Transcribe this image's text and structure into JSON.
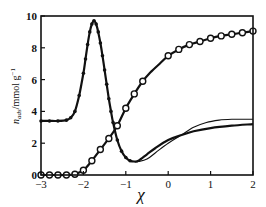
{
  "chart_data": {
    "type": "line",
    "title": "",
    "xlabel": "χ",
    "ylabel": "n_ads /mmol g⁻¹",
    "ylabel_main": "n",
    "ylabel_sub": "ads",
    "ylabel_units": "/mmol g",
    "ylabel_exp": "−1",
    "xlim": [
      -3,
      2
    ],
    "ylim": [
      0,
      10
    ],
    "x_ticks": [
      -3,
      -2,
      -1,
      0,
      1,
      2
    ],
    "x_tick_labels": [
      "−3",
      "−2",
      "−1",
      "0",
      "1",
      "2"
    ],
    "y_ticks": [
      0,
      2,
      4,
      6,
      8,
      10
    ],
    "y_tick_labels": [
      "0",
      "2",
      "4",
      "6",
      "8",
      "10"
    ],
    "grid": false,
    "legend": null,
    "series": [
      {
        "name": "peak-curve-fit",
        "style": "solid-line",
        "markers": "filled-dots",
        "x": [
          -3.0,
          -2.8,
          -2.6,
          -2.4,
          -2.3,
          -2.2,
          -2.1,
          -2.0,
          -1.95,
          -1.9,
          -1.85,
          -1.8,
          -1.75,
          -1.7,
          -1.65,
          -1.6,
          -1.55,
          -1.5,
          -1.45,
          -1.4,
          -1.35,
          -1.3,
          -1.2,
          -1.1,
          -1.0,
          -0.9,
          -0.8,
          -0.7,
          -0.5,
          -0.3,
          0.0,
          0.3,
          0.6,
          1.0,
          1.5,
          2.0
        ],
        "y": [
          3.4,
          3.4,
          3.4,
          3.45,
          3.6,
          4.0,
          5.0,
          6.4,
          7.3,
          8.2,
          9.0,
          9.5,
          9.7,
          9.5,
          9.0,
          8.3,
          7.5,
          6.6,
          5.7,
          4.8,
          4.0,
          3.3,
          2.2,
          1.5,
          1.1,
          0.9,
          0.85,
          0.9,
          1.3,
          1.7,
          2.2,
          2.5,
          2.75,
          2.95,
          3.1,
          3.2
        ]
      },
      {
        "name": "peak-curve-thin-line",
        "style": "thin-line",
        "markers": "none",
        "x": [
          -0.9,
          -0.8,
          -0.7,
          -0.5,
          -0.3,
          0.0,
          0.3,
          0.6,
          0.9,
          1.2,
          1.5,
          2.0
        ],
        "y": [
          0.9,
          0.85,
          0.85,
          1.0,
          1.4,
          2.0,
          2.5,
          3.0,
          3.3,
          3.45,
          3.5,
          3.5
        ]
      },
      {
        "name": "sigmoid-curve",
        "style": "solid-line",
        "markers": "open-circles",
        "x": [
          -3.0,
          -2.8,
          -2.6,
          -2.4,
          -2.2,
          -2.0,
          -1.8,
          -1.6,
          -1.4,
          -1.2,
          -1.0,
          -0.8,
          -0.6,
          -0.4,
          -0.2,
          0.0,
          0.25,
          0.5,
          0.75,
          1.0,
          1.25,
          1.5,
          1.75,
          2.0
        ],
        "y": [
          0.0,
          0.0,
          0.0,
          0.0,
          0.05,
          0.3,
          0.9,
          1.6,
          2.3,
          3.1,
          4.2,
          5.1,
          5.9,
          6.5,
          7.0,
          7.5,
          7.9,
          8.2,
          8.4,
          8.6,
          8.75,
          8.85,
          8.95,
          9.05
        ]
      }
    ]
  }
}
